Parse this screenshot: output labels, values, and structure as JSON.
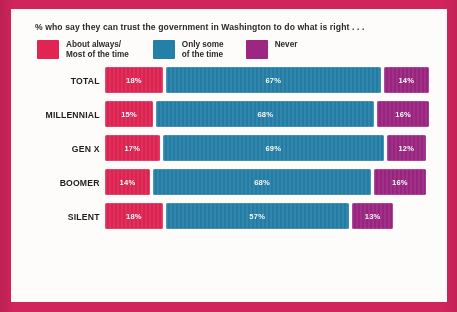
{
  "headline": "% who say they can trust the government in Washington to do what is right . . .",
  "colors": {
    "frame": "#d1245c",
    "card": "#fdfcfa",
    "always": "#e02554",
    "some": "#2580a8",
    "never": "#9c2682",
    "text": "#2a2a2e"
  },
  "legend": [
    {
      "label": "About always/\nMost of the time",
      "color": "#e02554",
      "key": "always"
    },
    {
      "label": "Only some\nof the time",
      "color": "#2580a8",
      "key": "some"
    },
    {
      "label": "Never",
      "color": "#9c2682",
      "key": "never"
    }
  ],
  "chart_data": {
    "type": "bar",
    "title": "% who say they can trust the government in Washington to do what is right . . .",
    "xlabel": "",
    "ylabel": "",
    "stacked": true,
    "orientation": "horizontal",
    "grid": false,
    "legend_position": "top",
    "unit": "%",
    "categories": [
      "TOTAL",
      "MILLENNIAL",
      "GEN X",
      "BOOMER",
      "SILENT"
    ],
    "series": [
      {
        "name": "About always/Most of the time",
        "color": "#e02554",
        "values": [
          18,
          15,
          17,
          14,
          18
        ]
      },
      {
        "name": "Only some of the time",
        "color": "#2580a8",
        "values": [
          67,
          68,
          69,
          68,
          57
        ]
      },
      {
        "name": "Never",
        "color": "#9c2682",
        "values": [
          14,
          16,
          12,
          16,
          13
        ]
      }
    ],
    "labels": [
      {
        "category": "TOTAL",
        "always": "18%",
        "some": "67%",
        "never": "14%"
      },
      {
        "category": "MILLENNIAL",
        "always": "15%",
        "some": "68%",
        "never": "16%"
      },
      {
        "category": "GEN X",
        "always": "17%",
        "some": "69%",
        "never": "12%"
      },
      {
        "category": "BOOMER",
        "always": "14%",
        "some": "68%",
        "never": "16%"
      },
      {
        "category": "SILENT",
        "always": "18%",
        "some": "57%",
        "never": "13%"
      }
    ]
  }
}
